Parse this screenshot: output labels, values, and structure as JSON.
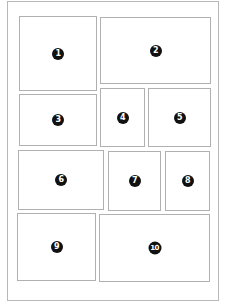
{
  "diagram": {
    "type": "panel-layout",
    "panels": [
      {
        "label": "1",
        "x": 19,
        "y": 16,
        "w": 78,
        "h": 75
      },
      {
        "label": "2",
        "x": 100,
        "y": 17,
        "w": 111,
        "h": 67
      },
      {
        "label": "3",
        "x": 19,
        "y": 94,
        "w": 78,
        "h": 52
      },
      {
        "label": "4",
        "x": 100,
        "y": 88,
        "w": 45,
        "h": 59
      },
      {
        "label": "5",
        "x": 148,
        "y": 88,
        "w": 63,
        "h": 59
      },
      {
        "label": "6",
        "x": 18,
        "y": 150,
        "w": 86,
        "h": 60
      },
      {
        "label": "7",
        "x": 108,
        "y": 151,
        "w": 53,
        "h": 60
      },
      {
        "label": "8",
        "x": 165,
        "y": 151,
        "w": 45,
        "h": 60
      },
      {
        "label": "9",
        "x": 17,
        "y": 213,
        "w": 79,
        "h": 68
      },
      {
        "label": "10",
        "x": 99,
        "y": 214,
        "w": 111,
        "h": 68
      }
    ]
  }
}
